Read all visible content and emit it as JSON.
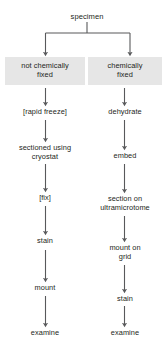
{
  "diagram": {
    "root": {
      "label": "specimen"
    },
    "branches": [
      {
        "id": "left",
        "header": "not chemically\nfixed",
        "header_boxed": true,
        "steps": [
          "[rapid freeze]",
          "sectioned using\ncryostat",
          "[fix]",
          "stain",
          "mount",
          "examine"
        ]
      },
      {
        "id": "right",
        "header": "chemically\nfixed",
        "header_boxed": true,
        "steps": [
          "dehydrate",
          "embed",
          "section on\nultramicrotome",
          "mount on\ngrid",
          "stain",
          "examine"
        ]
      }
    ],
    "colors": {
      "box_fill": "#e6e6e6",
      "text": "#231f20",
      "connector": "#58595b",
      "background": "#ffffff"
    }
  }
}
